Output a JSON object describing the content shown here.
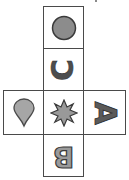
{
  "diagram": {
    "type": "cube-net",
    "faces": [
      {
        "id": "top",
        "symbol": "circle",
        "fill": "#8c8c8c",
        "stroke": "#3a3a3a"
      },
      {
        "id": "upper",
        "symbol": "letter",
        "char": "C",
        "rotation": -90,
        "fill": "#4d4d4d"
      },
      {
        "id": "left",
        "symbol": "teardrop",
        "fill": "#a6a6a6",
        "stroke": "#4a4a4a"
      },
      {
        "id": "center",
        "symbol": "eight-point-star",
        "fill": "#999999",
        "stroke": "#3a3a3a"
      },
      {
        "id": "right",
        "symbol": "letter",
        "char": "A",
        "rotation": 90,
        "fill": "#5a5a5a"
      },
      {
        "id": "bottom",
        "symbol": "letter",
        "char": "B",
        "rotation": 180,
        "fill": "#9a9a9a"
      }
    ],
    "labels": {
      "c": "C",
      "a": "A",
      "b": "B"
    },
    "border_color": "#4a4a4a"
  }
}
